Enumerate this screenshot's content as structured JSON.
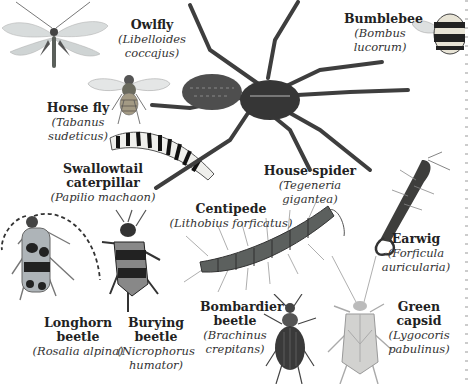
{
  "species": [
    {
      "id": "owlfly",
      "common": "Owlfly",
      "scientific_lines": [
        "(Libelloides",
        "coccajus)"
      ]
    },
    {
      "id": "horse-fly",
      "common": "Horse fly",
      "scientific_lines": [
        "(Tabanus",
        "sudeticus)"
      ]
    },
    {
      "id": "swallowtail",
      "common": "Swallowtail caterpillar",
      "scientific_lines": [
        "(Papilio machaon)"
      ]
    },
    {
      "id": "house-spider",
      "common": "House spider",
      "scientific_lines": [
        "(Tegeneria gigantea)"
      ]
    },
    {
      "id": "bumblebee",
      "common": "Bumblebee",
      "scientific_lines": [
        "(Bombus",
        "lucorum)"
      ]
    },
    {
      "id": "centipede",
      "common": "Centipede",
      "scientific_lines": [
        "(Lithobius forficatus)"
      ]
    },
    {
      "id": "earwig",
      "common": "Earwig",
      "scientific_lines": [
        "(Forficula",
        "auricularia)"
      ]
    },
    {
      "id": "longhorn",
      "common": "Longhorn beetle",
      "scientific_lines": [
        "(Rosalia alpina)"
      ]
    },
    {
      "id": "burying",
      "common": "Burying beetle",
      "scientific_lines": [
        "(Nicrophorus",
        "humator)"
      ]
    },
    {
      "id": "bombardier",
      "common_lines": [
        "Bombardier",
        "beetle"
      ],
      "scientific_lines": [
        "(Brachinus",
        "crepitans)"
      ]
    },
    {
      "id": "capsid",
      "common": "Green capsid",
      "scientific_lines": [
        "(Lygocoris",
        "pabulinus)"
      ]
    }
  ]
}
